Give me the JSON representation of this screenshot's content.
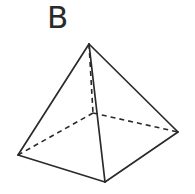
{
  "figure": {
    "label": "B",
    "shape": "square pyramid",
    "colors": {
      "line": "#2a2a2a",
      "background": "#ffffff"
    },
    "vertices": {
      "apex": [
        89,
        44
      ],
      "base_left": [
        18,
        155
      ],
      "base_front": [
        105,
        182
      ],
      "base_right": [
        178,
        132
      ],
      "base_back": [
        93,
        113
      ]
    },
    "visible_edges": [
      [
        "apex",
        "base_left"
      ],
      [
        "apex",
        "base_front"
      ],
      [
        "apex",
        "base_right"
      ],
      [
        "base_left",
        "base_front"
      ],
      [
        "base_front",
        "base_right"
      ]
    ],
    "hidden_edges": [
      [
        "apex",
        "base_back"
      ],
      [
        "base_back",
        "base_left"
      ],
      [
        "base_back",
        "base_right"
      ]
    ]
  }
}
